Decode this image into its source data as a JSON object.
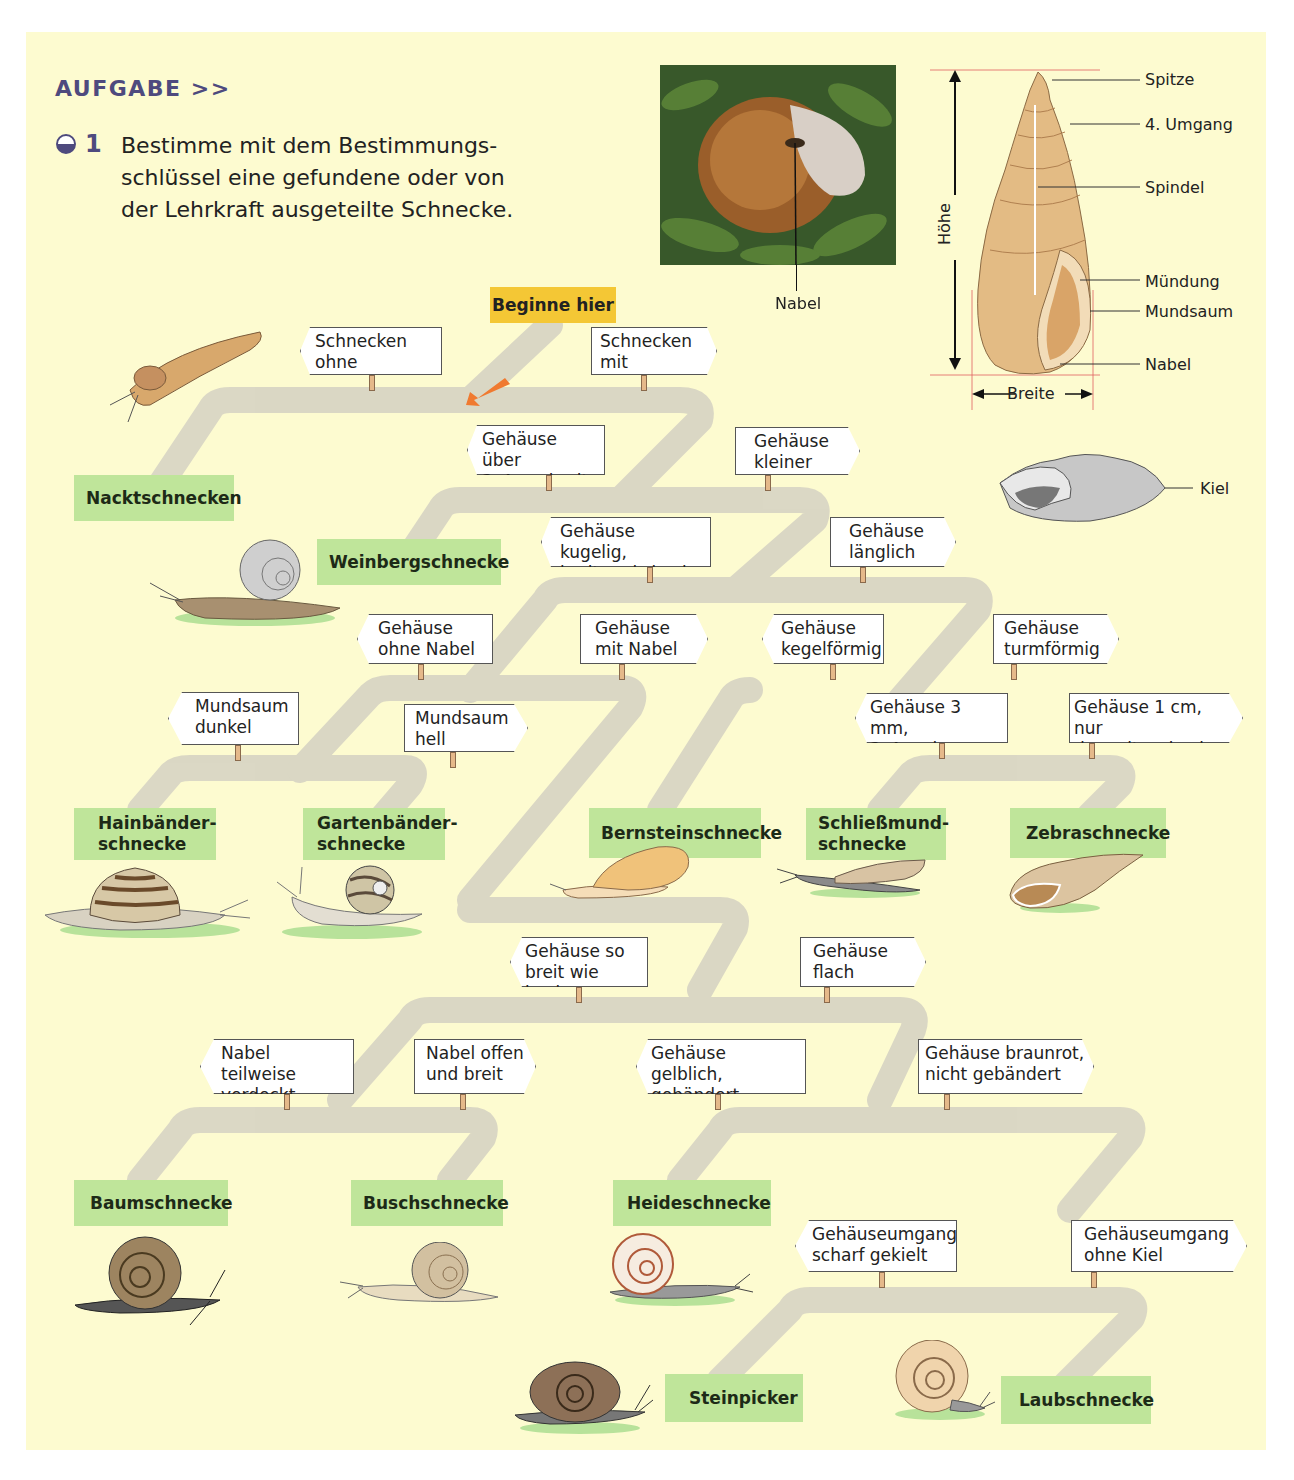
{
  "header": {
    "section_label": "AUFGABE >>",
    "task_number": "1",
    "task_text": "Bestimme mit dem Bestimmungs-schlüssel eine gefundene oder von der Lehrkraft ausgeteilte Schnecke."
  },
  "colors": {
    "background": "#fdfbd0",
    "accent_purple": "#4e4a7e",
    "result_green": "#bfe59a",
    "start_yellow": "#f4c735",
    "road_gray": "#d9d6c4",
    "arrow_orange": "#f07a30",
    "dimension_red": "#e06060"
  },
  "start": {
    "label": "Beginne hier"
  },
  "photo": {
    "label_nabel": "Nabel"
  },
  "shell_diagram": {
    "labels": [
      "Spitze",
      "4. Umgang",
      "Spindel",
      "Mündung",
      "Mundsaum",
      "Nabel"
    ],
    "height_label": "Höhe",
    "width_label": "Breite"
  },
  "keel_diagram": {
    "label": "Kiel"
  },
  "signs": [
    {
      "text": "Schnecken\nohne Gehäuse",
      "dir": "left"
    },
    {
      "text": "Schnecken\nmit Gehäuse",
      "dir": "right"
    },
    {
      "text": "Gehäuse über\n3–4 cm breit",
      "dir": "left"
    },
    {
      "text": "Gehäuse\nkleiner",
      "dir": "right"
    },
    {
      "text": "Gehäuse kugelig,\nbreiter als hoch",
      "dir": "left"
    },
    {
      "text": "Gehäuse\nlänglich",
      "dir": "right"
    },
    {
      "text": "Gehäuse\nohne Nabel",
      "dir": "left"
    },
    {
      "text": "Gehäuse\nmit Nabel",
      "dir": "right"
    },
    {
      "text": "Gehäuse\nkegelförmig",
      "dir": "left"
    },
    {
      "text": "Gehäuse\nturmförmig",
      "dir": "right"
    },
    {
      "text": "Mundsaum\ndunkel",
      "dir": "left"
    },
    {
      "text": "Mundsaum\nhell",
      "dir": "right"
    },
    {
      "text": "Gehäuse 3 mm,\n3–4 mal so hoch",
      "dir": "left"
    },
    {
      "text": "Gehäuse 1 cm, nur\ndoppelt so hoch",
      "dir": "right"
    },
    {
      "text": "Gehäuse so\nbreit wie hoch",
      "dir": "left"
    },
    {
      "text": "Gehäuse\nflach",
      "dir": "right"
    },
    {
      "text": "Nabel teilweise\nverdeckt",
      "dir": "left"
    },
    {
      "text": "Nabel offen\nund breit",
      "dir": "right"
    },
    {
      "text": "Gehäuse gelblich,\ngebändert",
      "dir": "left"
    },
    {
      "text": "Gehäuse braunrot,\nnicht gebändert",
      "dir": "right"
    },
    {
      "text": "Gehäuseumgang\nscharf gekielt",
      "dir": "left"
    },
    {
      "text": "Gehäuseumgang\nohne Kiel",
      "dir": "right"
    }
  ],
  "results": [
    "Nacktschnecken",
    "Weinbergschnecke",
    "Hainbänder-\nschnecke",
    "Gartenbänder-\nschnecke",
    "Bernsteinschnecke",
    "Schließmund-\nschnecke",
    "Zebraschnecke",
    "Baumschnecke",
    "Buschschnecke",
    "Heideschnecke",
    "Steinpicker",
    "Laubschnecke"
  ]
}
